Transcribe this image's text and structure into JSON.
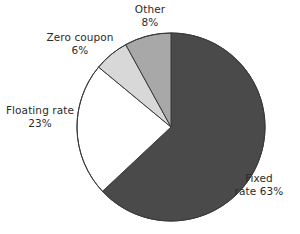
{
  "chart_data": {
    "type": "pie",
    "title": "",
    "subtitle": "",
    "xlabel": "",
    "ylabel": "",
    "legend_position": "none",
    "labels_position": "outside",
    "grid": false,
    "start_angle_deg": 0,
    "direction": "clockwise",
    "categories": [
      "Fixed rate",
      "Floating rate",
      "Zero coupon",
      "Other"
    ],
    "values": [
      63,
      23,
      6,
      8
    ],
    "value_unit": "%",
    "slices": [
      {
        "name": "Fixed rate",
        "value": 63,
        "value_text": "63%",
        "label_line1": "Fixed",
        "label_line2": "rate 63%",
        "color": "#4a4a4a",
        "start_deg": 0,
        "end_deg": 226.8
      },
      {
        "name": "Floating rate",
        "value": 23,
        "value_text": "23%",
        "label_line1": "Floating rate",
        "label_line2": "23%",
        "color": "#ffffff",
        "start_deg": 226.8,
        "end_deg": 309.6
      },
      {
        "name": "Zero coupon",
        "value": 6,
        "value_text": "6%",
        "label_line1": "Zero coupon",
        "label_line2": "6%",
        "color": "#d8d8d8",
        "start_deg": 309.6,
        "end_deg": 331.2
      },
      {
        "name": "Other",
        "value": 8,
        "value_text": "8%",
        "label_line1": "Other",
        "label_line2": "8%",
        "color": "#a8a8a8",
        "start_deg": 331.2,
        "end_deg": 360
      }
    ]
  },
  "colors": {
    "background": "#ffffff",
    "text": "#2b2b2b",
    "outline": "#3a3a3a",
    "fixed_rate": "#4a4a4a",
    "floating_rate": "#ffffff",
    "zero_coupon": "#d8d8d8",
    "other": "#a8a8a8"
  },
  "geometry": {
    "center_x": 171,
    "center_y": 127,
    "radius": 94
  }
}
